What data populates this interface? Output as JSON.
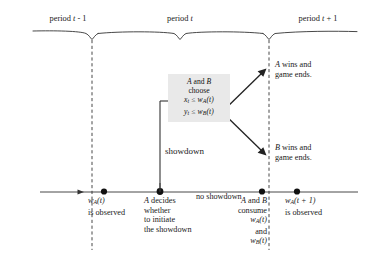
{
  "figure": {
    "name": "game-timeline-diagram",
    "background": "#ffffff",
    "ink": "#1a1a1a",
    "box_fill": "#e9e9e9"
  },
  "periods": [
    {
      "id": "prev",
      "label": "period t - 1",
      "label_plain": "period",
      "var": "t",
      "suffix": "- 1"
    },
    {
      "id": "current",
      "label": "period t",
      "label_plain": "period",
      "var": "t",
      "suffix": ""
    },
    {
      "id": "next",
      "label": "period t + 1",
      "label_plain": "period",
      "var": "t",
      "suffix": "+ 1"
    }
  ],
  "choice_box": {
    "line1_a": "A",
    "line1_and": " and ",
    "line1_b": "B",
    "line2": "choose",
    "line3": {
      "var": "x",
      "var_sub": "t",
      "rel": "≤",
      "fn": "w",
      "fn_sub": "A",
      "arg": "(t)"
    },
    "line4": {
      "var": "y",
      "var_sub": "t",
      "rel": "≤",
      "fn": "w",
      "fn_sub": "B",
      "arg": "(t)"
    }
  },
  "outcomes": [
    {
      "id": "a-wins",
      "player": "A",
      "line1_rest": " wins and",
      "line2": "game ends."
    },
    {
      "id": "b-wins",
      "player": "B",
      "line1_rest": " wins and",
      "line2": "game ends."
    }
  ],
  "branch_labels": {
    "showdown": "showdown",
    "no_showdown": "no showdown"
  },
  "timeline_events": [
    {
      "id": "w-observed",
      "lines": [
        {
          "fn": "w",
          "fn_sub": "A",
          "arg": "(t)"
        },
        {
          "text": "is observed"
        }
      ]
    },
    {
      "id": "a-decides",
      "lines": [
        {
          "actor": "A",
          "text": " decides"
        },
        {
          "text": "whether"
        },
        {
          "text": "to initiate"
        },
        {
          "text": "the showdown"
        }
      ]
    },
    {
      "id": "consume",
      "lines": [
        {
          "actor_a": "A",
          "mid": " and ",
          "actor_b": "B"
        },
        {
          "text": "consume"
        },
        {
          "fn": "w",
          "fn_sub": "A",
          "arg": "(t)"
        },
        {
          "text": "and"
        },
        {
          "fn": "w",
          "fn_sub": "B",
          "arg": "(t)"
        }
      ]
    },
    {
      "id": "w-next-observed",
      "lines": [
        {
          "fn": "w",
          "fn_sub": "A",
          "arg": "(t + 1)"
        },
        {
          "text": "is observed"
        }
      ]
    }
  ]
}
